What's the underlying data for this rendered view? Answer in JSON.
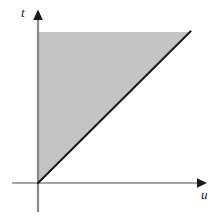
{
  "figure": {
    "title": "",
    "background_color": "#ffffff",
    "width": 222,
    "height": 220
  },
  "axes": {
    "horizontal": {
      "label": "u",
      "label_style": "italic-serif",
      "color": "#888888",
      "arrow_color": "#1a1a1a",
      "arrowhead": "right-arrow-icon",
      "start_x": 12,
      "end_x": 206,
      "y": 183,
      "thickness": 1
    },
    "vertical": {
      "label": "t",
      "label_style": "italic-serif",
      "color": "#888888",
      "arrow_color": "#1a1a1a",
      "arrowhead": "up-arrow-icon",
      "x": 38,
      "top_y": 10,
      "bottom_y": 212,
      "thickness": 2
    },
    "origin": {
      "x": 38,
      "y": 183
    }
  },
  "shaded_region": {
    "name": "shaded-triangle",
    "fill_color": "#c4c4c4",
    "description": "region above the line t = u",
    "vertices": [
      {
        "x": 38,
        "y": 183
      },
      {
        "x": 38,
        "y": 32
      },
      {
        "x": 190,
        "y": 32
      }
    ]
  },
  "boundary_line": {
    "name": "diagonal-boundary-line",
    "color": "#1a1a1a",
    "thickness": 2,
    "from": {
      "x": 38,
      "y": 183
    },
    "to": {
      "x": 190,
      "y": 32
    },
    "slope_description": "45-degree line t = u"
  },
  "chart_data": {
    "type": "area",
    "title": "",
    "xlabel": "u",
    "ylabel": "t",
    "xlim": [
      0,
      1.105
    ],
    "ylim": [
      0,
      1.126
    ],
    "grid": false,
    "legend": null,
    "series": [
      {
        "name": "t = u",
        "kind": "line",
        "x": [
          0,
          1
        ],
        "values": [
          0,
          1
        ],
        "color": "#1a1a1a"
      },
      {
        "name": "shaded region t > u",
        "kind": "fill_between",
        "x": [
          0,
          1
        ],
        "y_lower": [
          0,
          1
        ],
        "y_upper": [
          1,
          1
        ],
        "color": "#c4c4c4"
      }
    ],
    "annotations": [
      {
        "text": "t",
        "x": -0.1,
        "y": 1.14,
        "style": "italic"
      },
      {
        "text": "u",
        "x": 1.09,
        "y": -0.07,
        "style": "italic"
      }
    ]
  }
}
